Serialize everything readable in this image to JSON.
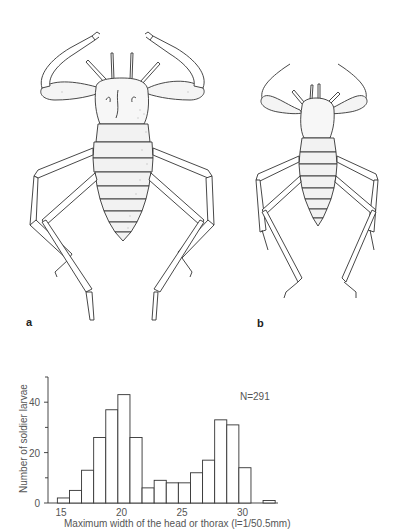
{
  "figure": {
    "panels": [
      {
        "label": "a",
        "description": "soldier larva illustration (large)"
      },
      {
        "label": "b",
        "description": "soldier larva illustration (small)"
      }
    ]
  },
  "chart_data": {
    "type": "bar",
    "title": "",
    "xlabel": "Maximum width of the head or thorax (l=1/50.5mm)",
    "ylabel": "Number of soldier larvae",
    "annotation": "N=291",
    "xlim": [
      14.5,
      33
    ],
    "ylim": [
      0,
      50
    ],
    "x_ticks": [
      15,
      20,
      25,
      30
    ],
    "y_ticks": [
      0,
      20,
      40
    ],
    "y_minor_ticks": [
      10,
      30,
      50
    ],
    "grid": false,
    "bin_width": 1,
    "bin_starts": [
      14.7,
      15.7,
      16.7,
      17.7,
      18.7,
      19.7,
      20.7,
      21.7,
      22.7,
      23.7,
      24.7,
      25.7,
      26.7,
      27.7,
      28.7,
      29.7,
      30.7,
      31.7
    ],
    "values": [
      2,
      5,
      13,
      26,
      37,
      43,
      26,
      6,
      9,
      8,
      8,
      12,
      17,
      33,
      31,
      14,
      0,
      1
    ],
    "bar_fill": "#ffffff",
    "bar_stroke": "#333333"
  }
}
